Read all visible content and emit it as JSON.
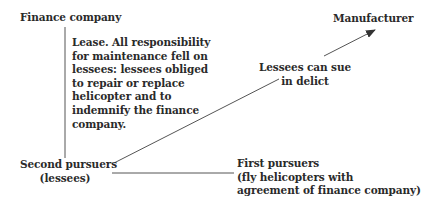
{
  "diagram": {
    "nodes": {
      "finance_company": {
        "label": "Finance company"
      },
      "manufacturer": {
        "label": "Manufacturer"
      },
      "second_pursuers": {
        "lines": [
          "Second pursuers",
          "(lessees)"
        ]
      },
      "first_pursuers": {
        "lines": [
          "First pursuers",
          "(fly helicopters with",
          "agreement of finance company)"
        ]
      }
    },
    "edges": {
      "lease": {
        "from": "finance_company",
        "to": "second_pursuers",
        "lines": [
          "Lease. All responsibility",
          "for maintenance fell on",
          "lessees: lessees obliged",
          "to repair or replace",
          "helicopter and to",
          "indemnify the finance",
          "company."
        ]
      },
      "delict": {
        "from": "second_pursuers",
        "to": "manufacturer",
        "arrow": true,
        "lines": [
          "Lessees can sue",
          "in delict"
        ]
      },
      "pursuers_link": {
        "from": "second_pursuers",
        "to": "first_pursuers"
      }
    },
    "colors": {
      "line": "#555555",
      "text": "#2a2a2a",
      "background": "#ffffff"
    }
  }
}
